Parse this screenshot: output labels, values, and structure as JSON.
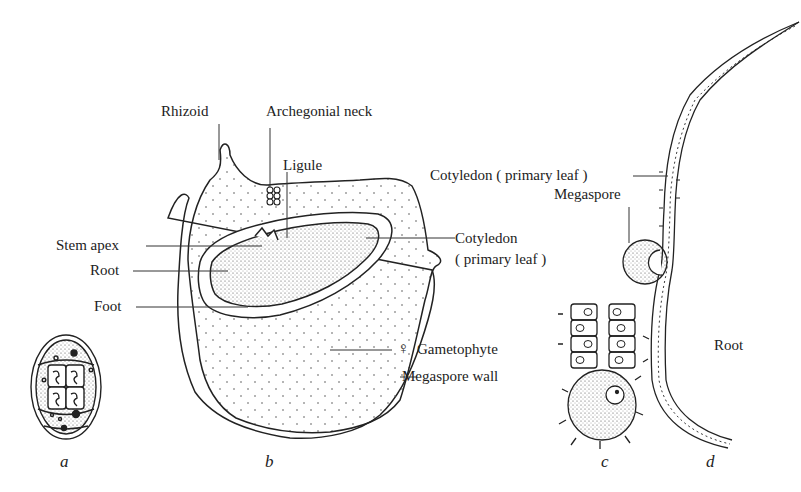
{
  "figure": {
    "panels": [
      {
        "id": "a",
        "label": "a"
      },
      {
        "id": "b",
        "label": "b"
      },
      {
        "id": "c",
        "label": "c"
      },
      {
        "id": "d",
        "label": "d"
      }
    ],
    "labels": {
      "rhizoid": "Rhizoid",
      "archegonial_neck": "Archegonial neck",
      "ligule": "Ligule",
      "stem_apex": "Stem apex",
      "root_b": "Root",
      "foot": "Foot",
      "cotyledon_b_line1": "Cotyledon",
      "cotyledon_b_line2": "( primary leaf )",
      "gametophyte": "Gametophyte",
      "female_symbol": "♀",
      "megaspore_wall": "Megaspore wall",
      "cotyledon_d": "Cotyledon ( primary leaf )",
      "megaspore": "Megaspore",
      "root_d": "Root"
    }
  }
}
